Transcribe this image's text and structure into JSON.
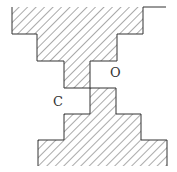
{
  "diagram": {
    "type": "cross-section",
    "colors": {
      "stroke": "#333333",
      "hatch": "#555555",
      "background": "#ffffff"
    },
    "labels": {
      "c": "C",
      "o": "O"
    },
    "upper_shape": {
      "points": [
        [
          12,
          7
        ],
        [
          143,
          7
        ],
        [
          143,
          34
        ],
        [
          117,
          34
        ],
        [
          117,
          61
        ],
        [
          90,
          61
        ],
        [
          90,
          88
        ],
        [
          64,
          88
        ],
        [
          64,
          61
        ],
        [
          37,
          61
        ],
        [
          37,
          34
        ],
        [
          12,
          34
        ]
      ]
    },
    "lower_shape": {
      "points": [
        [
          90,
          88
        ],
        [
          116,
          88
        ],
        [
          116,
          114
        ],
        [
          141,
          114
        ],
        [
          141,
          140
        ],
        [
          167,
          140
        ],
        [
          167,
          166
        ],
        [
          38,
          166
        ],
        [
          38,
          140
        ],
        [
          64,
          140
        ],
        [
          64,
          114
        ],
        [
          90,
          114
        ]
      ]
    },
    "top_right_line": {
      "x1": 143,
      "y1": 7,
      "x2": 166,
      "y2": 7
    }
  }
}
